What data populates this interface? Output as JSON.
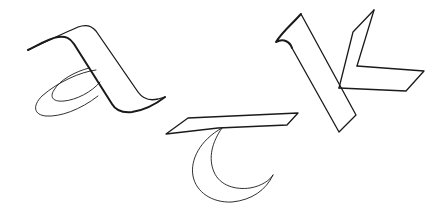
{
  "image": {
    "description": "Hand-drawn outline sketch of calligraphic letterforms",
    "background_color": "#ffffff",
    "ink_color": "#1a1a1a"
  },
  "letters": [
    {
      "id": "a",
      "glyph": "a",
      "position": "upper-left"
    },
    {
      "id": "t",
      "glyph": "t",
      "position": "lower-center"
    },
    {
      "id": "k",
      "glyph": "k",
      "position": "upper-right"
    }
  ]
}
